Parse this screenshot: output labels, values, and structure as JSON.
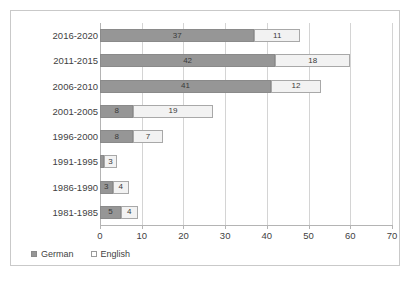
{
  "chart_data": {
    "type": "bar",
    "subtype": "horizontal-stacked-bar",
    "title": "",
    "xlabel": "",
    "ylabel": "",
    "xlim": [
      0,
      70
    ],
    "xticks": [
      0,
      10,
      20,
      30,
      40,
      50,
      60,
      70
    ],
    "grid": true,
    "legend_position": "bottom-left",
    "categories": [
      "2016-2020",
      "2011-2015",
      "2006-2010",
      "2001-2005",
      "1996-2000",
      "1991-1995",
      "1986-1990",
      "1981-1985"
    ],
    "series": [
      {
        "name": "German",
        "color": "#969696",
        "values": [
          37,
          42,
          41,
          8,
          8,
          1,
          3,
          5
        ]
      },
      {
        "name": "English",
        "color": "#f2f2f2",
        "values": [
          11,
          18,
          12,
          19,
          7,
          3,
          4,
          4
        ]
      }
    ],
    "data_labels": {
      "2016-2020": {
        "German": "37",
        "English": "11"
      },
      "2011-2015": {
        "German": "42",
        "English": "18"
      },
      "2006-2010": {
        "German": "41",
        "English": "12"
      },
      "2001-2005": {
        "German": "8",
        "English": "19"
      },
      "1996-2000": {
        "German": "8",
        "English": "7"
      },
      "1991-1995": {
        "German": "",
        "English": "3"
      },
      "1986-1990": {
        "German": "3",
        "English": "4"
      },
      "1981-1985": {
        "German": "5",
        "English": "4"
      }
    }
  },
  "legend": {
    "items": [
      {
        "label": "German",
        "swatch": "filled-gray-square"
      },
      {
        "label": "English",
        "swatch": "outlined-white-square"
      }
    ]
  }
}
